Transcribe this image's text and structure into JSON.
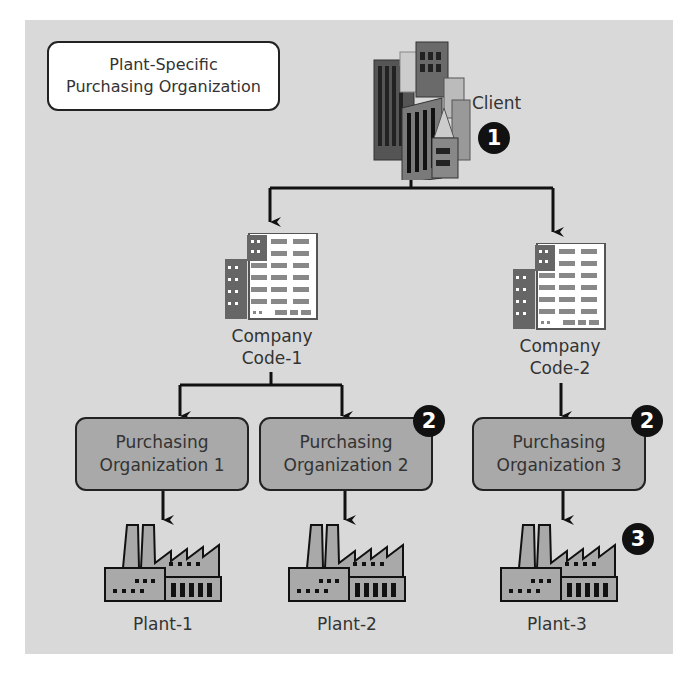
{
  "title": {
    "line1": "Plant-Specific",
    "line2": "Purchasing Organization"
  },
  "client": {
    "label": "Client",
    "badge": "1",
    "icon": "city-buildings-icon"
  },
  "company_codes": [
    {
      "line1": "Company",
      "line2": "Code-1",
      "icon": "office-building-icon"
    },
    {
      "line1": "Company",
      "line2": "Code-2",
      "icon": "office-building-icon"
    }
  ],
  "purchasing_orgs": [
    {
      "line1": "Purchasing",
      "line2": "Organization 1"
    },
    {
      "line1": "Purchasing",
      "line2": "Organization 2",
      "badge": "2"
    },
    {
      "line1": "Purchasing",
      "line2": "Organization 3",
      "badge": "2"
    }
  ],
  "plants": [
    {
      "label": "Plant-1",
      "icon": "factory-icon"
    },
    {
      "label": "Plant-2",
      "icon": "factory-icon"
    },
    {
      "label": "Plant-3",
      "icon": "factory-icon",
      "badge": "3"
    }
  ],
  "colors": {
    "background": "#d9d9d9",
    "org_box": "#a9a9a9",
    "badge": "#111111",
    "line": "#111111"
  }
}
